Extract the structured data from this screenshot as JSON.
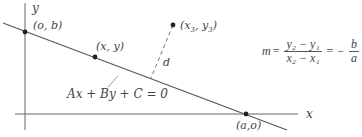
{
  "diagram": {
    "axes": {
      "x_label": "x",
      "y_label": "y"
    },
    "points": [
      {
        "id": "y-intercept",
        "label": "(o, b)",
        "px": 25,
        "py": 32
      },
      {
        "id": "general-point",
        "label": "(x, y)",
        "px": 95,
        "py": 57
      },
      {
        "id": "external-point",
        "label_base": "(x",
        "sub1": "3",
        "mid": ", y",
        "sub2": "3",
        "end": ")",
        "px": 173,
        "py": 25
      },
      {
        "id": "x-intercept",
        "label": "(a,o)",
        "px": 246,
        "py": 114
      }
    ],
    "line_equation": "Ax + By + C = 0",
    "distance_label": "d",
    "slope_formula": {
      "lhs": "m",
      "eq1": "=",
      "num": "y₂ − y₁",
      "den": "x₂ − x₁",
      "eq2": "=",
      "neg": "−",
      "num2": "b",
      "den2": "a"
    },
    "colors": {
      "line": "#555555",
      "point": "#222222",
      "text": "#444444"
    }
  }
}
